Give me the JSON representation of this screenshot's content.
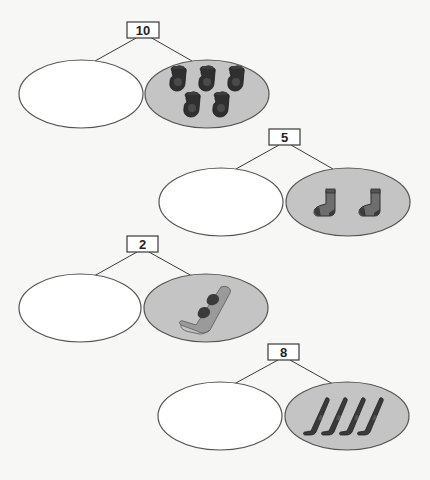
{
  "colors": {
    "background": "#f7f7f5",
    "filled_part": "#c4c4c4",
    "empty_part": "#ffffff",
    "outline": "#555555",
    "mitten": "#2f2f2f",
    "sock": "#6e6e6e",
    "ski": "#3a3a3a"
  },
  "bonds": [
    {
      "whole": "10",
      "known_part": {
        "item": "mitten-icon",
        "count": 5
      },
      "unknown_part": ""
    },
    {
      "whole": "5",
      "known_part": {
        "item": "sock-icon",
        "count": 2
      },
      "unknown_part": ""
    },
    {
      "whole": "2",
      "known_part": {
        "item": "snowboard-icon",
        "count": 1
      },
      "unknown_part": ""
    },
    {
      "whole": "8",
      "known_part": {
        "item": "ski-icon",
        "count": 4
      },
      "unknown_part": ""
    }
  ]
}
